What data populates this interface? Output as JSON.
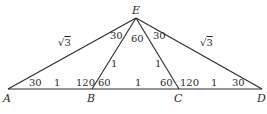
{
  "diagram": {
    "vertices": {
      "A": {
        "label": "A",
        "x": 8,
        "y": 89
      },
      "B": {
        "label": "B",
        "x": 92,
        "y": 89
      },
      "C": {
        "label": "C",
        "x": 179,
        "y": 89
      },
      "D": {
        "label": "D",
        "x": 262,
        "y": 89
      },
      "E": {
        "label": "E",
        "x": 136,
        "y": 18
      }
    },
    "segments": [
      {
        "from": "A",
        "to": "D"
      },
      {
        "from": "A",
        "to": "E"
      },
      {
        "from": "B",
        "to": "E"
      },
      {
        "from": "C",
        "to": "E"
      },
      {
        "from": "D",
        "to": "E"
      }
    ],
    "side_labels": {
      "AE": {
        "prefix": "√",
        "radicand": "3"
      },
      "DE": {
        "prefix": "√",
        "radicand": "3"
      },
      "BE": "1",
      "CE": "1",
      "AB": "1",
      "BC": "1",
      "CD": "1"
    },
    "angle_labels": {
      "A": "30",
      "ABE": "120",
      "EBC": "60",
      "BCE": "60",
      "ECD": "120",
      "D": "30",
      "AEB": "30",
      "BEC": "60",
      "CED": "30"
    }
  }
}
